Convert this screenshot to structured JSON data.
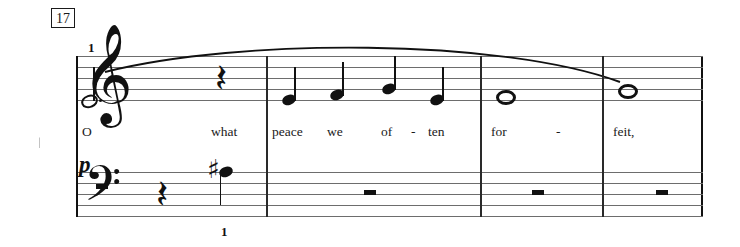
{
  "score": {
    "measure_number": "17",
    "dynamic": "p",
    "clefs": {
      "treble": "\u0001d11e",
      "bass": "\u0001d122"
    },
    "lyrics": [
      {
        "text": "O",
        "x": 82,
        "interactable": false
      },
      {
        "text": "what",
        "x": 211,
        "interactable": false
      },
      {
        "text": "peace",
        "x": 272,
        "interactable": false
      },
      {
        "text": "we",
        "x": 327,
        "interactable": false
      },
      {
        "text": "of",
        "x": 381,
        "interactable": false
      },
      {
        "text": "-",
        "x": 411,
        "interactable": false
      },
      {
        "text": "ten",
        "x": 428,
        "interactable": false
      },
      {
        "text": "for",
        "x": 491,
        "interactable": false
      },
      {
        "text": "-",
        "x": 556,
        "interactable": false
      },
      {
        "text": "feit,",
        "x": 613,
        "interactable": false
      }
    ],
    "fingerings": [
      {
        "label": "1",
        "x": 88,
        "y": 40,
        "staff": "treble"
      },
      {
        "label": "1",
        "x": 221,
        "y": 224,
        "staff": "bass"
      }
    ],
    "barlines_x": [
      266,
      480,
      602
    ],
    "treble_notes": [
      {
        "name": "dotted-half-note",
        "x": 88,
        "y": 100,
        "duration": "half-dotted",
        "head": "hollow",
        "stem": "up"
      },
      {
        "name": "quarter-rest",
        "x": 222,
        "y": 62,
        "duration": "quarter-rest"
      },
      {
        "name": "quarter-note",
        "x": 289,
        "y": 100,
        "duration": "quarter",
        "head": "filled",
        "stem": "up"
      },
      {
        "name": "quarter-note",
        "x": 337,
        "y": 95,
        "duration": "quarter",
        "head": "filled",
        "stem": "up"
      },
      {
        "name": "quarter-note",
        "x": 389,
        "y": 89,
        "duration": "quarter",
        "head": "filled",
        "stem": "up"
      },
      {
        "name": "quarter-note",
        "x": 437,
        "y": 100,
        "duration": "quarter",
        "head": "filled",
        "stem": "up"
      },
      {
        "name": "whole-note",
        "x": 503,
        "y": 95,
        "duration": "whole",
        "head": "whole"
      },
      {
        "name": "whole-note",
        "x": 625,
        "y": 89,
        "duration": "whole",
        "head": "whole"
      }
    ],
    "bass_notes": [
      {
        "name": "half-rest",
        "x": 102,
        "y": 189,
        "duration": "half-rest"
      },
      {
        "name": "quarter-rest",
        "x": 163,
        "y": 178,
        "duration": "quarter-rest"
      },
      {
        "name": "sharp-note",
        "x": 226,
        "y": 172,
        "duration": "quarter",
        "accidental": "sharp",
        "accidental_x": 207,
        "stem": "down"
      },
      {
        "name": "whole-rest",
        "x": 370,
        "y": 194,
        "duration": "whole-rest"
      },
      {
        "name": "whole-rest",
        "x": 538,
        "y": 194,
        "duration": "whole-rest"
      },
      {
        "name": "whole-rest",
        "x": 662,
        "y": 194,
        "duration": "whole-rest"
      }
    ],
    "slur": {
      "start_x": 100,
      "start_y": 72,
      "end_x": 622,
      "end_y": 80,
      "peak_y": 46
    },
    "colors": {
      "ink": "#111111",
      "staff_line": "#6d6d6d",
      "background": "#ffffff"
    }
  }
}
